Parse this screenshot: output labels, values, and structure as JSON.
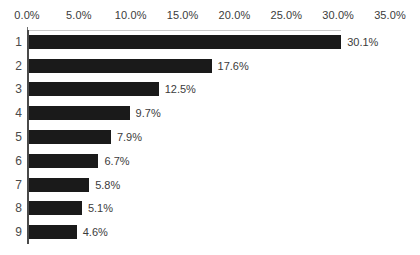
{
  "chart_data": {
    "type": "bar",
    "orientation": "horizontal",
    "title": "",
    "subtitle": "",
    "xlabel": "",
    "ylabel": "",
    "categories": [
      "1",
      "2",
      "3",
      "4",
      "5",
      "6",
      "7",
      "8",
      "9"
    ],
    "values": [
      30.1,
      17.6,
      12.5,
      9.7,
      7.9,
      6.7,
      5.8,
      5.1,
      4.6
    ],
    "data_labels": [
      "30.1%",
      "17.6%",
      "12.5%",
      "9.7%",
      "7.9%",
      "6.7%",
      "5.8%",
      "5.1%",
      "4.6%"
    ],
    "xlim": [
      0,
      35
    ],
    "xticks": [
      0,
      5,
      10,
      15,
      20,
      25,
      30,
      35
    ],
    "xtick_labels": [
      "0.0%",
      "5.0%",
      "10.0%",
      "15.0%",
      "20.0%",
      "25.0%",
      "30.0%",
      "35.0%"
    ],
    "grid": false,
    "legend": false,
    "legend_position": "none",
    "series": [
      {
        "name": "",
        "values": [
          30.1,
          17.6,
          12.5,
          9.7,
          7.9,
          6.7,
          5.8,
          5.1,
          4.6
        ]
      }
    ],
    "colors": {
      "bar": "#1a1a1a",
      "background": "#ffffff",
      "axis_line": "#4a4a4a",
      "top_rule": "#c9c9c9",
      "tick_label": "#3b3b3b",
      "category_label": "#4a4a4a",
      "value_label": "#3b3b3b"
    }
  }
}
